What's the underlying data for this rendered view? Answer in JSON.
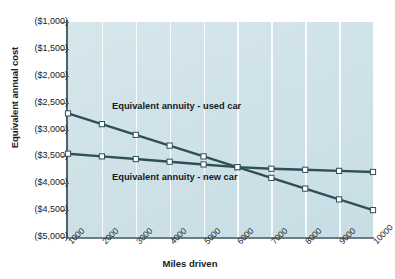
{
  "chart_data": {
    "type": "line",
    "title": "",
    "xlabel": "Miles driven",
    "ylabel": "Equivalent annual cost",
    "x": [
      1000,
      2000,
      3000,
      4000,
      5000,
      6000,
      7000,
      8000,
      9000,
      10000
    ],
    "xtick_labels": [
      "1000",
      "2000",
      "3000",
      "4000",
      "5000",
      "6000",
      "7000",
      "8000",
      "9000",
      "10000"
    ],
    "ytick_labels": [
      "($1,000)",
      "($1,500)",
      "($2,000)",
      "($2,500)",
      "($3,000)",
      "($3,500)",
      "($4,000)",
      "($4,500)",
      "($5,000)"
    ],
    "ytick_values": [
      -1000,
      -1500,
      -2000,
      -2500,
      -3000,
      -3500,
      -4000,
      -4500,
      -5000
    ],
    "ylim": [
      -5000,
      -1000
    ],
    "xlim": [
      1000,
      10000
    ],
    "grid": "vertical-only",
    "legend": "inline-annotations",
    "series": [
      {
        "name": "Equivalent annuity - used car",
        "color": "#2e4f58",
        "marker": "square-open",
        "values": [
          -2700,
          -2900,
          -3100,
          -3300,
          -3500,
          -3700,
          -3900,
          -4100,
          -4300,
          -4500
        ]
      },
      {
        "name": "Equivalent annuity - new car",
        "color": "#2e4f58",
        "marker": "square-open",
        "values": [
          -3450,
          -3500,
          -3550,
          -3600,
          -3650,
          -3700,
          -3730,
          -3750,
          -3770,
          -3790
        ]
      }
    ],
    "annotations": [
      {
        "text": "Equivalent annuity - used car",
        "x": 2300,
        "y": -2580
      },
      {
        "text": "Equivalent annuity - new car",
        "x": 2300,
        "y": -3900
      }
    ]
  },
  "colors": {
    "plot_background": "#d2e3e9",
    "gridline": "#ffffff",
    "line": "#2e4f58",
    "marker_fill": "#ffffff",
    "axis": "#5b6d72",
    "text": "#1b1b1b"
  }
}
